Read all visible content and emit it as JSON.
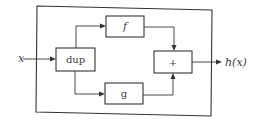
{
  "diagram": {
    "type": "block-diagram",
    "input_label": "x",
    "output_label": "h(x)",
    "blocks": {
      "dup": "dup",
      "f": "f",
      "g": "g",
      "sum": "+"
    },
    "connections": [
      {
        "from": "x",
        "to": "dup"
      },
      {
        "from": "dup",
        "to": "f"
      },
      {
        "from": "dup",
        "to": "g"
      },
      {
        "from": "f",
        "to": "+"
      },
      {
        "from": "g",
        "to": "+"
      },
      {
        "from": "+",
        "to": "h(x)"
      }
    ]
  }
}
